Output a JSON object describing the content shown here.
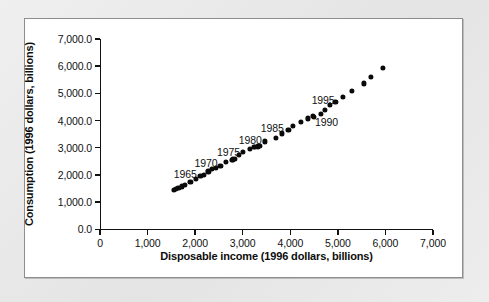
{
  "chart_data": {
    "type": "scatter",
    "title": "",
    "xlabel": "Disposable income (1996 dollars, billions)",
    "ylabel": "Consumption (1996 dollars, billions)",
    "xlim": [
      0,
      7000
    ],
    "ylim": [
      0,
      7000
    ],
    "grid": false,
    "legend": "none",
    "xticks": [
      0,
      1000,
      2000,
      3000,
      4000,
      5000,
      6000,
      7000
    ],
    "xtick_labels": [
      "0",
      "1,000",
      "2,000",
      "3,000",
      "4,000",
      "5,000",
      "6,000",
      "7,000"
    ],
    "yticks": [
      0,
      1000,
      2000,
      3000,
      4000,
      5000,
      6000,
      7000
    ],
    "ytick_labels": [
      "0.0",
      "1,000.0",
      "2,000.0",
      "3,000.0",
      "4,000.0",
      "5,000.0",
      "6,000.0",
      "7,000.0"
    ],
    "marker": "filled-circle",
    "marker_color": "#0a0a0a",
    "series": [
      {
        "name": "Consumption vs disposable income",
        "points": [
          {
            "year": 1959,
            "x": 1560,
            "y": 1440
          },
          {
            "year": 1960,
            "x": 1600,
            "y": 1480
          },
          {
            "year": 1961,
            "x": 1650,
            "y": 1510
          },
          {
            "year": 1962,
            "x": 1720,
            "y": 1580
          },
          {
            "year": 1963,
            "x": 1780,
            "y": 1640
          },
          {
            "year": 1964,
            "x": 1900,
            "y": 1740
          },
          {
            "year": 1965,
            "x": 2010,
            "y": 1850
          },
          {
            "year": 1966,
            "x": 2110,
            "y": 1960
          },
          {
            "year": 1967,
            "x": 2190,
            "y": 2010
          },
          {
            "year": 1968,
            "x": 2280,
            "y": 2130
          },
          {
            "year": 1969,
            "x": 2350,
            "y": 2210
          },
          {
            "year": 1970,
            "x": 2440,
            "y": 2250
          },
          {
            "year": 1971,
            "x": 2530,
            "y": 2320
          },
          {
            "year": 1972,
            "x": 2640,
            "y": 2470
          },
          {
            "year": 1973,
            "x": 2800,
            "y": 2570
          },
          {
            "year": 1974,
            "x": 2770,
            "y": 2540
          },
          {
            "year": 1975,
            "x": 2830,
            "y": 2600
          },
          {
            "year": 1976,
            "x": 2920,
            "y": 2740
          },
          {
            "year": 1977,
            "x": 3010,
            "y": 2850
          },
          {
            "year": 1978,
            "x": 3150,
            "y": 2970
          },
          {
            "year": 1979,
            "x": 3230,
            "y": 3040
          },
          {
            "year": 1980,
            "x": 3250,
            "y": 3020
          },
          {
            "year": 1981,
            "x": 3320,
            "y": 3050
          },
          {
            "year": 1982,
            "x": 3360,
            "y": 3080
          },
          {
            "year": 1983,
            "x": 3460,
            "y": 3230
          },
          {
            "year": 1984,
            "x": 3690,
            "y": 3370
          },
          {
            "year": 1985,
            "x": 3820,
            "y": 3530
          },
          {
            "year": 1986,
            "x": 3960,
            "y": 3670
          },
          {
            "year": 1987,
            "x": 4050,
            "y": 3790
          },
          {
            "year": 1988,
            "x": 4230,
            "y": 3960
          },
          {
            "year": 1989,
            "x": 4370,
            "y": 4080
          },
          {
            "year": 1990,
            "x": 4480,
            "y": 4160
          },
          {
            "year": 1991,
            "x": 4500,
            "y": 4140
          },
          {
            "year": 1992,
            "x": 4650,
            "y": 4240
          },
          {
            "year": 1993,
            "x": 4720,
            "y": 4390
          },
          {
            "year": 1994,
            "x": 4840,
            "y": 4570
          },
          {
            "year": 1995,
            "x": 4950,
            "y": 4700
          },
          {
            "year": 1996,
            "x": 5110,
            "y": 4880
          },
          {
            "year": 1997,
            "x": 5290,
            "y": 5080
          },
          {
            "year": 1998,
            "x": 5540,
            "y": 5370
          },
          {
            "year": 1999,
            "x": 5690,
            "y": 5620
          },
          {
            "year": 2000,
            "x": 5940,
            "y": 5940
          }
        ]
      }
    ],
    "annotations": [
      {
        "label": "1965",
        "x": 1790,
        "y": 2050
      },
      {
        "label": "1970",
        "x": 2230,
        "y": 2450
      },
      {
        "label": "1975",
        "x": 2700,
        "y": 2830
      },
      {
        "label": "1980",
        "x": 3160,
        "y": 3270
      },
      {
        "label": "1985",
        "x": 3620,
        "y": 3730
      },
      {
        "label": "1990",
        "x": 4760,
        "y": 3960
      },
      {
        "label": "1995",
        "x": 4690,
        "y": 4760
      }
    ]
  }
}
